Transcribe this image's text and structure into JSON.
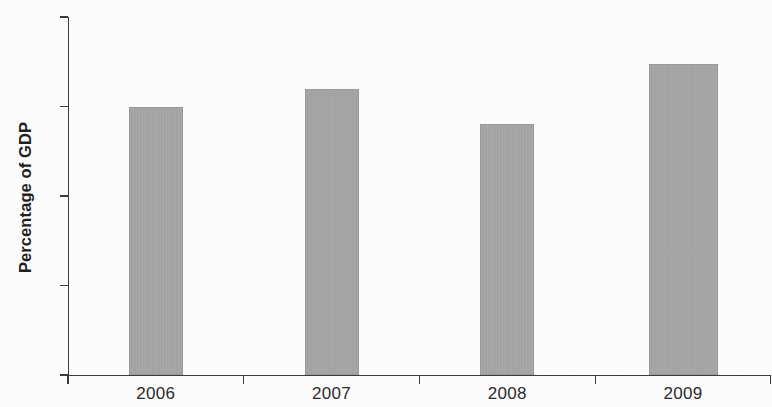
{
  "chart_data": {
    "type": "bar",
    "title": "",
    "xlabel": "",
    "ylabel": "Percentage of GDP",
    "categories": [
      "2006",
      "2007",
      "2008",
      "2009"
    ],
    "values": [
      3.0,
      3.2,
      2.8,
      3.47
    ],
    "ylim": [
      0,
      4
    ],
    "y_ticks": [
      "0",
      "1",
      "2",
      "3",
      "4"
    ],
    "y_tick_values": [
      0,
      1,
      2,
      3,
      4
    ],
    "grid": false,
    "legend": "none",
    "series": [
      {
        "name": "Percentage of GDP",
        "values": [
          3.0,
          3.2,
          2.8,
          3.47
        ],
        "color": "#a9a9a9"
      }
    ],
    "colors": {
      "bar_fill": "#a9a9a9",
      "axis": "#3a3a3a",
      "text": "#2b2b2b",
      "background": "#fdfdfd"
    }
  }
}
